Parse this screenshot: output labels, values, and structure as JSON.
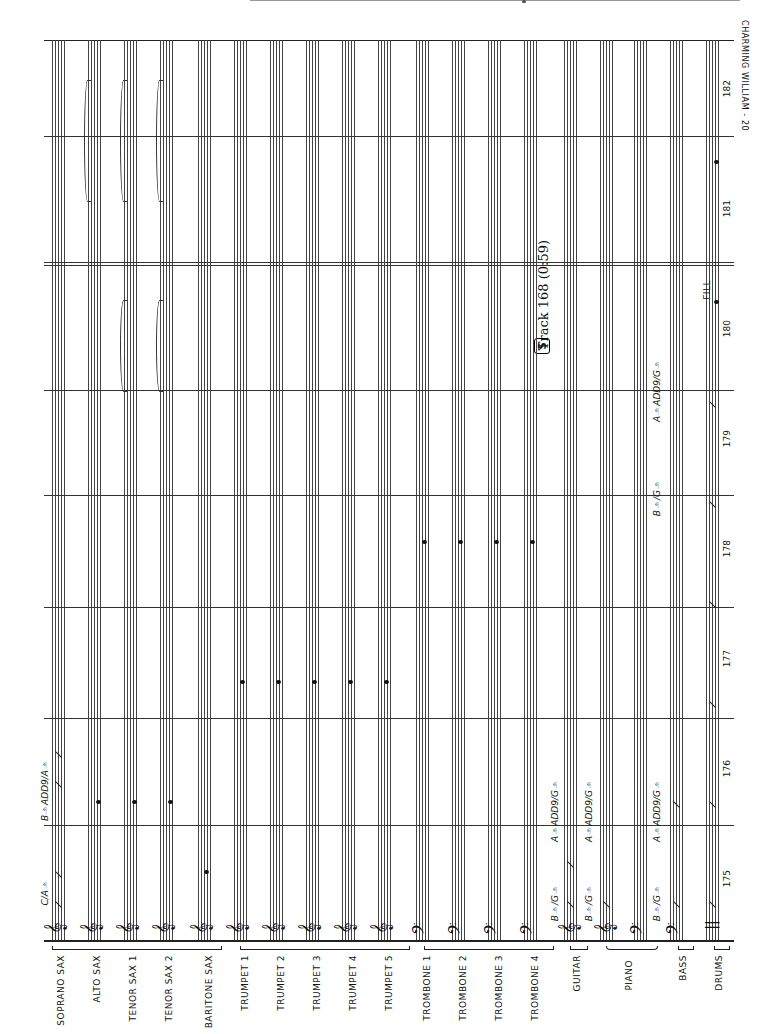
{
  "header": {
    "title": "CHARMING WILLIAM - 20",
    "track_label": "Track 168 (0:59)",
    "track_icon": "S"
  },
  "score": {
    "sections": [
      {
        "name": "saxes",
        "instruments": [
          "SOPRANO SAX",
          "ALTO SAX",
          "TENOR SAX 1",
          "TENOR SAX 2",
          "BARITONE SAX"
        ]
      },
      {
        "name": "trumpets",
        "instruments": [
          "TRUMPET 1",
          "TRUMPET 2",
          "TRUMPET 3",
          "TRUMPET 4",
          "TRUMPET 5"
        ]
      },
      {
        "name": "trombones",
        "instruments": [
          "TROMBONE 1",
          "TROMBONE 2",
          "TROMBONE 3",
          "TROMBONE 4"
        ]
      },
      {
        "name": "rhythm",
        "instruments": [
          "GUITAR",
          "PIANO",
          "BASS",
          "DRUMS"
        ]
      }
    ],
    "instruments": [
      {
        "label": "SOPRANO SAX",
        "clef": "treble-clef-icon"
      },
      {
        "label": "ALTO SAX",
        "clef": "treble-clef-icon"
      },
      {
        "label": "TENOR SAX 1",
        "clef": "treble-clef-icon"
      },
      {
        "label": "TENOR SAX 2",
        "clef": "treble-clef-icon"
      },
      {
        "label": "BARITONE SAX",
        "clef": "treble-clef-icon"
      },
      {
        "label": "TRUMPET 1",
        "clef": "treble-clef-icon"
      },
      {
        "label": "TRUMPET 2",
        "clef": "treble-clef-icon"
      },
      {
        "label": "TRUMPET 3",
        "clef": "treble-clef-icon"
      },
      {
        "label": "TRUMPET 4",
        "clef": "treble-clef-icon"
      },
      {
        "label": "TRUMPET 5",
        "clef": "treble-clef-icon"
      },
      {
        "label": "TROMBONE 1",
        "clef": "bass-clef-icon"
      },
      {
        "label": "TROMBONE 2",
        "clef": "bass-clef-icon"
      },
      {
        "label": "TROMBONE 3",
        "clef": "bass-clef-icon"
      },
      {
        "label": "TROMBONE 4",
        "clef": "bass-clef-icon"
      },
      {
        "label": "GUITAR",
        "clef": "treble-clef-icon"
      },
      {
        "label": "PIANO",
        "clef": "grand-staff-icon"
      },
      {
        "label": "BASS",
        "clef": "bass-clef-icon"
      },
      {
        "label": "DRUMS",
        "clef": "percussion-clef-icon"
      }
    ],
    "chord_symbols": {
      "soprano": [
        "C/A♭",
        "B♭ADD9/A♭"
      ],
      "guitar": [
        "B♭/G♭",
        "A♭ADD9/G♭"
      ],
      "piano": [
        "B♭/G♭",
        "A♭ADD9/G♭"
      ],
      "bass": [
        "B♭/G♭",
        "A♭ADD9/G♭",
        "B♭/G♭",
        "A♭ADD9/G♭"
      ]
    },
    "measure_numbers": [
      "175",
      "176",
      "177",
      "178",
      "179",
      "180",
      "181",
      "182"
    ],
    "fill_label": "FILL",
    "rehearsal_segno": "𝄋"
  }
}
